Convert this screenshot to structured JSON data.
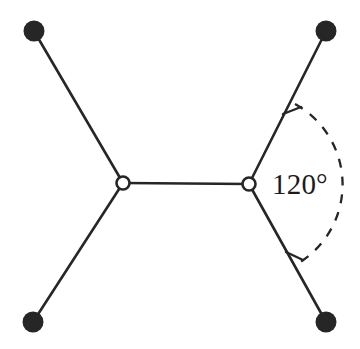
{
  "figure": {
    "background_color": "#ffffff",
    "line_color": "#262626",
    "atom_fill_color": "#262626",
    "vertex_fill_color": "#ffffff",
    "angle_label": "120°",
    "nodes": {
      "left_vertex": {
        "name": "left-vertex",
        "x": 123,
        "y": 183,
        "r": 6.5,
        "style": "hollow"
      },
      "right_vertex": {
        "name": "right-vertex",
        "x": 249,
        "y": 184,
        "r": 6.5,
        "style": "hollow"
      },
      "top_left_atom": {
        "name": "top-left-atom",
        "x": 34,
        "y": 31,
        "r": 10,
        "style": "filled"
      },
      "top_right_atom": {
        "name": "top-right-atom",
        "x": 326,
        "y": 31,
        "r": 10,
        "style": "filled"
      },
      "bottom_left_atom": {
        "name": "bottom-left-atom",
        "x": 33,
        "y": 322,
        "r": 10,
        "style": "filled"
      },
      "bottom_right_atom": {
        "name": "bottom-right-atom",
        "x": 326,
        "y": 322,
        "r": 10,
        "style": "filled"
      }
    },
    "bonds": [
      {
        "name": "bond-center",
        "x1": 123,
        "y1": 183,
        "x2": 249,
        "y2": 184
      },
      {
        "name": "bond-top-left",
        "x1": 123,
        "y1": 183,
        "x2": 34,
        "y2": 31
      },
      {
        "name": "bond-bottom-left",
        "x1": 123,
        "y1": 183,
        "x2": 33,
        "y2": 322
      },
      {
        "name": "bond-top-right",
        "x1": 249,
        "y1": 184,
        "x2": 326,
        "y2": 31
      },
      {
        "name": "bond-bottom-right",
        "x1": 249,
        "y1": 184,
        "x2": 326,
        "y2": 322
      }
    ],
    "angle_arc": {
      "name": "angle-arc",
      "center_x": 249,
      "center_y": 184,
      "radius": 92,
      "start_x": 295,
      "start_y": 104,
      "end_x": 297,
      "end_y": 264,
      "dash": "8 8",
      "measure": "120°"
    },
    "arc_ticks": [
      {
        "name": "arc-tick-top",
        "x1": 285,
        "y1": 113,
        "x2": 300,
        "y2": 108
      },
      {
        "name": "arc-tick-bottom",
        "x1": 287,
        "y1": 253,
        "x2": 302,
        "y2": 259
      }
    ],
    "angle_label_position": {
      "x": 272,
      "y": 194
    }
  }
}
